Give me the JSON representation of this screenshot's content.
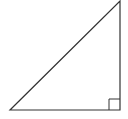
{
  "diagram": {
    "type": "right-triangle",
    "stroke_color": "#333333",
    "background": "#ffffff",
    "vertices": {
      "left": [
        10,
        110
      ],
      "right_angle": [
        120,
        110
      ],
      "top": [
        120,
        1
      ]
    },
    "right_angle_marker_size": 11
  }
}
